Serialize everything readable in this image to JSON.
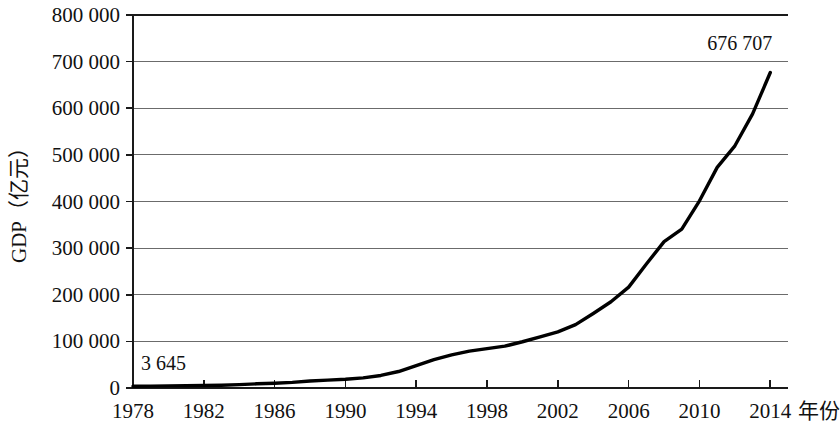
{
  "chart_data": {
    "type": "line",
    "title": "",
    "xlabel": "年份",
    "ylabel": "GDP（亿元）",
    "xlim": [
      1978,
      2015
    ],
    "ylim": [
      0,
      800000
    ],
    "grid": true,
    "legend": "none",
    "y_ticks": [
      0,
      100000,
      200000,
      300000,
      400000,
      500000,
      600000,
      700000,
      800000
    ],
    "y_tick_labels": [
      "0",
      "100 000",
      "200 000",
      "300 000",
      "400 000",
      "500 000",
      "600 000",
      "700 000",
      "800 000"
    ],
    "x_ticks": [
      1978,
      1982,
      1986,
      1990,
      1994,
      1998,
      2002,
      2006,
      2010,
      2014
    ],
    "x_tick_labels": [
      "1978",
      "1982",
      "1986",
      "1990",
      "1994",
      "1998",
      "2002",
      "2006",
      "2010",
      "2014"
    ],
    "series": [
      {
        "name": "GDP",
        "color": "#000000",
        "x": [
          1978,
          1979,
          1980,
          1981,
          1982,
          1983,
          1984,
          1985,
          1986,
          1987,
          1988,
          1989,
          1990,
          1991,
          1992,
          1993,
          1994,
          1995,
          1996,
          1997,
          1998,
          1999,
          2000,
          2001,
          2002,
          2003,
          2004,
          2005,
          2006,
          2007,
          2008,
          2009,
          2010,
          2011,
          2012,
          2013,
          2014
        ],
        "values": [
          3645,
          4063,
          4546,
          4892,
          5323,
          5963,
          7208,
          9016,
          10275,
          12059,
          15043,
          16992,
          18668,
          21781,
          26923,
          35334,
          48198,
          60794,
          71177,
          78973,
          84402,
          89677,
          99215,
          109655,
          120333,
          135823,
          159878,
          184937,
          216314,
          265810,
          314045,
          340903,
          401513,
          473104,
          519470,
          588019,
          676707
        ]
      }
    ],
    "annotations": [
      {
        "name": "start-value-label",
        "text": "3 645",
        "year": 1978,
        "value": 3645
      },
      {
        "name": "end-value-label",
        "text": "676 707",
        "year": 2014,
        "value": 676707
      }
    ]
  }
}
